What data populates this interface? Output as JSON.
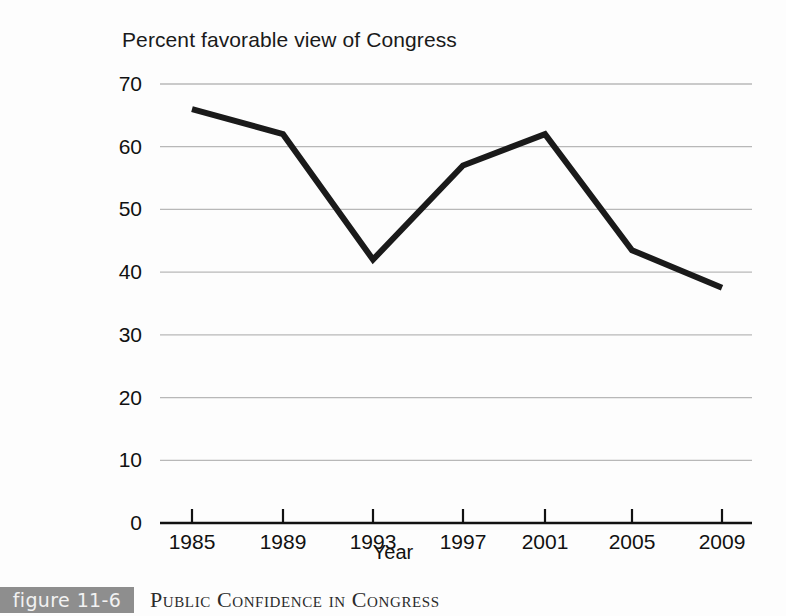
{
  "figure": {
    "badge_label": "figure 11-6",
    "caption": "Public Confidence in Congress"
  },
  "chart_data": {
    "type": "line",
    "title": "Percent favorable view of Congress",
    "xlabel": "Year",
    "ylabel": "",
    "categories": [
      "1985",
      "1989",
      "1993",
      "1997",
      "2001",
      "2005",
      "2009"
    ],
    "x": [
      1985,
      1989,
      1993,
      1997,
      2001,
      2005,
      2009
    ],
    "values": [
      66,
      62,
      42,
      57,
      62,
      43.5,
      37.5
    ],
    "series": [
      {
        "name": "Percent favorable view of Congress",
        "values": [
          66,
          62,
          42,
          57,
          62,
          43.5,
          37.5
        ]
      }
    ],
    "ylim": [
      0,
      70
    ],
    "xlim": [
      1985,
      2009
    ],
    "y_ticks": [
      0,
      10,
      20,
      30,
      40,
      50,
      60,
      70
    ],
    "y_tick_labels": [
      "0",
      "10",
      "20",
      "30",
      "40",
      "50",
      "60",
      "70"
    ],
    "x_ticks": [
      1985,
      1989,
      1993,
      1997,
      2001,
      2005,
      2009
    ],
    "x_tick_labels": [
      "1985",
      "1989",
      "1993",
      "1997",
      "2001",
      "2005",
      "2009"
    ],
    "grid": true,
    "grid_axis": "y",
    "legend": false,
    "legend_position": "none",
    "line_color": "#1a1a1a",
    "grid_color": "#b8b8b8",
    "axis_color": "#111111",
    "background_color": "#fdfdfd"
  }
}
